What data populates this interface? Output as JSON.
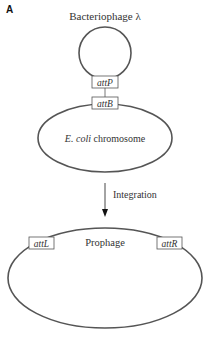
{
  "figure": {
    "panel_label": "A",
    "phage": {
      "title": "Bacteriophage λ",
      "site_label": "attP"
    },
    "chromosome": {
      "site_label": "attB",
      "label_italic": "E. coli",
      "label_rest": " chromosome"
    },
    "step": {
      "label": "Integration"
    },
    "result": {
      "left_site": "attL",
      "right_site": "attR",
      "label": "Prophage"
    },
    "colors": {
      "stroke": "#555555",
      "text": "#333333"
    }
  }
}
